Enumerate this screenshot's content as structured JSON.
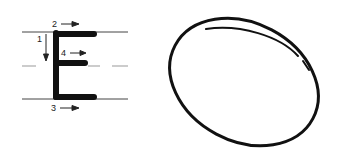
{
  "diagram": {
    "letter": "E",
    "strokes": [
      {
        "number": "1",
        "direction": "down"
      },
      {
        "number": "2",
        "direction": "right"
      },
      {
        "number": "3",
        "direction": "right"
      },
      {
        "number": "4",
        "direction": "right"
      }
    ],
    "shape": "oval",
    "colors": {
      "ink": "#111111",
      "guide": "#444444",
      "dashed": "#999999"
    }
  }
}
